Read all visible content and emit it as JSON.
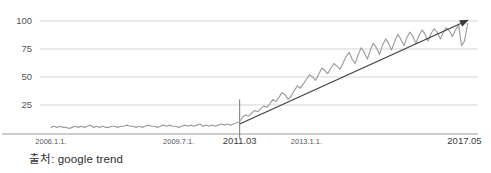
{
  "caption": {
    "source_text": "출처: google trend"
  },
  "chart_data": {
    "type": "line",
    "title": "",
    "xlabel": "",
    "ylabel": "",
    "ylim": [
      0,
      108
    ],
    "yticks": [
      25,
      50,
      75,
      100
    ],
    "ytick_labels": [
      "25",
      "50",
      "75",
      "100"
    ],
    "grid": true,
    "legend": null,
    "xtick_labels": [
      "2006.1.1.",
      "2009.7.1.",
      "2011.03",
      "2013.1.1.",
      "2017.05"
    ],
    "xtick_positions": [
      2006.0,
      2009.5,
      2011.17,
      2013.0,
      2017.33
    ],
    "xlim": [
      2005.7,
      2017.7
    ],
    "emphasized_xtick": "2011.03",
    "colors": {
      "data_line": "#9d9da2",
      "trend_arrow": "#3c3c40",
      "gridline": "#c9c9cc",
      "axis": "#8d8e92",
      "tick_text": "#55565a"
    },
    "series": [
      {
        "name": "google trend interest",
        "color": "#9d9da2",
        "x": [
          2006.0,
          2006.08,
          2006.17,
          2006.25,
          2006.33,
          2006.42,
          2006.5,
          2006.58,
          2006.67,
          2006.75,
          2006.83,
          2006.92,
          2007.0,
          2007.08,
          2007.17,
          2007.25,
          2007.33,
          2007.42,
          2007.5,
          2007.58,
          2007.67,
          2007.75,
          2007.83,
          2007.92,
          2008.0,
          2008.08,
          2008.17,
          2008.25,
          2008.33,
          2008.42,
          2008.5,
          2008.58,
          2008.67,
          2008.75,
          2008.83,
          2008.92,
          2009.0,
          2009.08,
          2009.17,
          2009.25,
          2009.33,
          2009.42,
          2009.5,
          2009.58,
          2009.67,
          2009.75,
          2009.83,
          2009.92,
          2010.0,
          2010.08,
          2010.17,
          2010.25,
          2010.33,
          2010.42,
          2010.5,
          2010.58,
          2010.67,
          2010.75,
          2010.83,
          2010.92,
          2011.0,
          2011.08,
          2011.17,
          2011.25,
          2011.33,
          2011.42,
          2011.5,
          2011.58,
          2011.67,
          2011.75,
          2011.83,
          2011.92,
          2012.0,
          2012.08,
          2012.17,
          2012.25,
          2012.33,
          2012.42,
          2012.5,
          2012.58,
          2012.67,
          2012.75,
          2012.83,
          2012.92,
          2013.0,
          2013.08,
          2013.17,
          2013.25,
          2013.33,
          2013.42,
          2013.5,
          2013.58,
          2013.67,
          2013.75,
          2013.83,
          2013.92,
          2014.0,
          2014.08,
          2014.17,
          2014.25,
          2014.33,
          2014.42,
          2014.5,
          2014.58,
          2014.67,
          2014.75,
          2014.83,
          2014.92,
          2015.0,
          2015.08,
          2015.17,
          2015.25,
          2015.33,
          2015.42,
          2015.5,
          2015.58,
          2015.67,
          2015.75,
          2015.83,
          2015.92,
          2016.0,
          2016.08,
          2016.17,
          2016.25,
          2016.33,
          2016.42,
          2016.5,
          2016.58,
          2016.67,
          2016.75,
          2016.83,
          2016.92,
          2017.0,
          2017.08,
          2017.17,
          2017.25,
          2017.33,
          2017.42
        ],
        "values": [
          5,
          6,
          5,
          6,
          5,
          5,
          4,
          5,
          6,
          5,
          6,
          5,
          6,
          7,
          5,
          6,
          5,
          6,
          5,
          5,
          6,
          6,
          5,
          6,
          6,
          7,
          6,
          6,
          5,
          6,
          5,
          6,
          7,
          6,
          6,
          5,
          6,
          7,
          6,
          7,
          6,
          6,
          5,
          6,
          7,
          6,
          7,
          6,
          7,
          8,
          6,
          7,
          6,
          7,
          6,
          7,
          8,
          7,
          8,
          7,
          8,
          9,
          10,
          14,
          16,
          15,
          18,
          20,
          19,
          22,
          24,
          23,
          26,
          30,
          28,
          32,
          36,
          34,
          30,
          33,
          38,
          42,
          40,
          44,
          48,
          52,
          50,
          47,
          52,
          58,
          56,
          53,
          58,
          62,
          60,
          57,
          62,
          68,
          72,
          66,
          62,
          70,
          76,
          72,
          66,
          74,
          80,
          76,
          70,
          78,
          84,
          80,
          74,
          82,
          88,
          84,
          78,
          85,
          90,
          86,
          80,
          87,
          92,
          88,
          82,
          89,
          93,
          90,
          84,
          90,
          94,
          91,
          86,
          92,
          96,
          78,
          82,
          98
        ]
      }
    ],
    "annotations": [
      {
        "type": "arrow",
        "name": "trend-arrow",
        "from_x": 2011.17,
        "from_y": 8,
        "to_x": 2017.45,
        "to_y": 101,
        "color": "#3c3c40"
      },
      {
        "type": "vline",
        "name": "marker-2011-03",
        "x": 2011.17,
        "color": "#7a7b7f"
      }
    ]
  }
}
